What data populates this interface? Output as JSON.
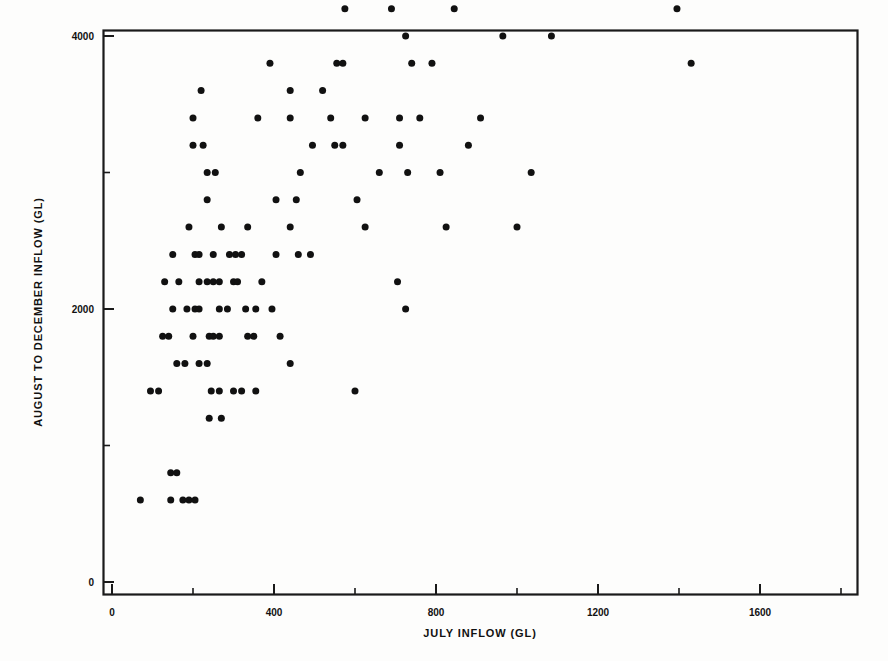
{
  "figure": {
    "background_color": "#fdfdfc",
    "ink_color": "#1a1a1a",
    "marker_color": "#111111"
  },
  "axes": {
    "x_axis_title": "JULY INFLOW (GL)",
    "y_axis_title": "AUGUST TO DECEMBER INFLOW (GL)",
    "x_tick_labels": [
      "0",
      "400",
      "800",
      "1200",
      "1600"
    ],
    "y_tick_labels": [
      "0",
      "2000",
      "4000",
      "6000"
    ],
    "x_minor_ticks": [
      200,
      600,
      1000,
      1400,
      1800
    ],
    "y_minor_ticks": [
      1000,
      3000,
      5000,
      7000
    ]
  },
  "chart_data": {
    "type": "scatter",
    "title": "",
    "xlabel": "JULY INFLOW (GL)",
    "ylabel": "AUGUST TO DECEMBER INFLOW (GL)",
    "xlim": [
      -20,
      1840
    ],
    "ylim": [
      -100,
      7800
    ],
    "xticks": [
      0,
      400,
      800,
      1200,
      1600
    ],
    "yticks": [
      0,
      2000,
      4000,
      6000
    ],
    "grid": false,
    "legend": null,
    "marker": "filled-circle",
    "marker_color": "#111111",
    "marker_size_px": 7,
    "n_points": 124,
    "points": [
      [
        70,
        600
      ],
      [
        145,
        800
      ],
      [
        160,
        800
      ],
      [
        145,
        600
      ],
      [
        175,
        600
      ],
      [
        190,
        600
      ],
      [
        205,
        600
      ],
      [
        95,
        1400
      ],
      [
        115,
        1400
      ],
      [
        245,
        1400
      ],
      [
        265,
        1400
      ],
      [
        300,
        1400
      ],
      [
        320,
        1400
      ],
      [
        355,
        1400
      ],
      [
        600,
        1400
      ],
      [
        240,
        1200
      ],
      [
        270,
        1200
      ],
      [
        160,
        1600
      ],
      [
        180,
        1600
      ],
      [
        215,
        1600
      ],
      [
        235,
        1600
      ],
      [
        440,
        1600
      ],
      [
        125,
        1800
      ],
      [
        140,
        1800
      ],
      [
        200,
        1800
      ],
      [
        240,
        1800
      ],
      [
        250,
        1800
      ],
      [
        335,
        1800
      ],
      [
        350,
        1800
      ],
      [
        150,
        2000
      ],
      [
        205,
        2000
      ],
      [
        215,
        2000
      ],
      [
        265,
        2000
      ],
      [
        725,
        2000
      ],
      [
        130,
        2200
      ],
      [
        165,
        2200
      ],
      [
        215,
        2200
      ],
      [
        235,
        2200
      ],
      [
        250,
        2200
      ],
      [
        265,
        2200
      ],
      [
        300,
        2200
      ],
      [
        370,
        2200
      ],
      [
        705,
        2200
      ],
      [
        150,
        2400
      ],
      [
        205,
        2400
      ],
      [
        215,
        2400
      ],
      [
        250,
        2400
      ],
      [
        290,
        2400
      ],
      [
        305,
        2400
      ],
      [
        405,
        2400
      ],
      [
        460,
        2400
      ],
      [
        270,
        2600
      ],
      [
        440,
        2600
      ],
      [
        625,
        2600
      ],
      [
        825,
        2600
      ],
      [
        1000,
        2600
      ],
      [
        405,
        2800
      ],
      [
        605,
        2800
      ],
      [
        235,
        3000
      ],
      [
        255,
        3000
      ],
      [
        730,
        3000
      ],
      [
        810,
        3000
      ],
      [
        1035,
        3000
      ],
      [
        200,
        3200
      ],
      [
        495,
        3200
      ],
      [
        550,
        3200
      ],
      [
        570,
        3200
      ],
      [
        710,
        3200
      ],
      [
        880,
        3200
      ],
      [
        200,
        3400
      ],
      [
        360,
        3400
      ],
      [
        440,
        3400
      ],
      [
        540,
        3400
      ],
      [
        625,
        3400
      ],
      [
        710,
        3400
      ],
      [
        220,
        3600
      ],
      [
        440,
        3600
      ],
      [
        390,
        3800
      ],
      [
        555,
        3800
      ],
      [
        570,
        3800
      ],
      [
        740,
        3800
      ],
      [
        790,
        3800
      ],
      [
        1430,
        3800
      ],
      [
        725,
        4000
      ],
      [
        965,
        4000
      ],
      [
        1085,
        4000
      ],
      [
        575,
        4200
      ],
      [
        845,
        4200
      ],
      [
        1395,
        4200
      ],
      [
        460,
        4400
      ],
      [
        780,
        4400
      ],
      [
        800,
        4400
      ],
      [
        610,
        4600
      ],
      [
        880,
        4600
      ],
      [
        1365,
        5000
      ],
      [
        500,
        5400
      ],
      [
        870,
        5400
      ],
      [
        1295,
        6200
      ],
      [
        1300,
        7400
      ],
      [
        330,
        2000
      ],
      [
        355,
        2000
      ],
      [
        320,
        2400
      ],
      [
        185,
        2000
      ],
      [
        190,
        2600
      ],
      [
        235,
        2800
      ],
      [
        285,
        2000
      ],
      [
        310,
        2200
      ],
      [
        265,
        1800
      ],
      [
        455,
        2800
      ],
      [
        465,
        3000
      ],
      [
        490,
        2400
      ],
      [
        335,
        2600
      ],
      [
        395,
        2000
      ],
      [
        520,
        3600
      ],
      [
        660,
        3000
      ],
      [
        760,
        3400
      ],
      [
        910,
        3400
      ],
      [
        960,
        4400
      ],
      [
        1100,
        4400
      ],
      [
        1180,
        4600
      ],
      [
        415,
        1800
      ],
      [
        690,
        4200
      ],
      [
        225,
        3200
      ]
    ]
  }
}
